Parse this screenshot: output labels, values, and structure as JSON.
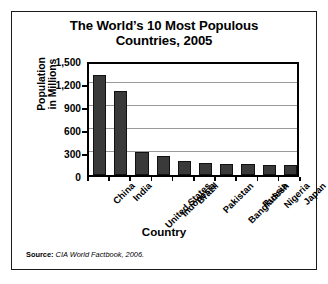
{
  "figure": {
    "title_line1": "The World’s 10 Most Populous",
    "title_line2": "Countries, 2005",
    "source_label": "Source:",
    "source_text": "CIA World Factbook, 2006.",
    "border_color": "#1a1a1a",
    "background_color": "#ffffff"
  },
  "axes": {
    "y_title_line1": "Population",
    "y_title_line2": "in Millions",
    "x_title": "Country"
  },
  "chart_data": {
    "type": "bar",
    "title": "The World’s 10 Most Populous Countries, 2005",
    "xlabel": "Country",
    "ylabel": "Population in Millions",
    "ylim": [
      0,
      1500
    ],
    "ytick_values": [
      0,
      300,
      600,
      900,
      1200,
      1500
    ],
    "ytick_labels": [
      "0",
      "300",
      "600",
      "900",
      "1,200",
      "1,500"
    ],
    "grid": true,
    "gridline_values": [
      300,
      600,
      900,
      1200
    ],
    "legend": null,
    "bar_color": "#3a3a3a",
    "bar_edge_color": "#111111",
    "categories": [
      "China",
      "India",
      "United States",
      "Indonesia",
      "Brazil",
      "Pakistan",
      "Bangladesh",
      "Russia",
      "Nigeria",
      "Japan"
    ],
    "values": [
      1306,
      1095,
      296,
      242,
      186,
      162,
      144,
      143,
      129,
      127
    ],
    "source": "CIA World Factbook, 2006."
  }
}
